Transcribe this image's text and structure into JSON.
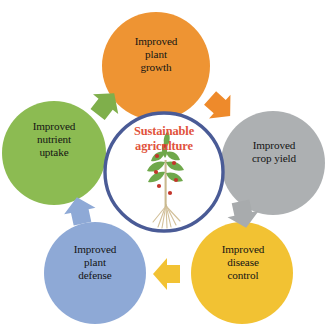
{
  "diagram": {
    "title": "Sustainable agriculture",
    "title_color": "#E1533C",
    "center_ring_color": "#4A5B96",
    "background_color": "#FFFFFF",
    "type": "cycle-diagram",
    "center": {
      "label": "Sustainable\nagriculture",
      "illustration": "plant-with-fruit-and-roots",
      "leaf_color": "#6FA84B",
      "fruit_color": "#C3352B",
      "root_color": "#D9C9A8",
      "stem_color": "#C9B98F"
    },
    "nodes": [
      {
        "id": "plant-growth",
        "label": "Improved\nplant\ngrowth",
        "color": "#EE9433",
        "position": "top"
      },
      {
        "id": "crop-yield",
        "label": "Improved\ncrop yield",
        "color": "#ADB0B2",
        "position": "right"
      },
      {
        "id": "disease-control",
        "label": "Improved\ndisease\ncontrol",
        "color": "#F2C233",
        "position": "bottom-right"
      },
      {
        "id": "plant-defense",
        "label": "Improved\nplant\ndefense",
        "color": "#8EA9D6",
        "position": "bottom-left"
      },
      {
        "id": "nutrient-uptake",
        "label": "Improved\nnutrient\nuptake",
        "color": "#8CBB52",
        "position": "left"
      }
    ],
    "arrows": [
      {
        "id": "nutrient-uptake-to-plant-growth",
        "color": "#7FAF4B",
        "direction": "up-right"
      },
      {
        "id": "plant-growth-to-crop-yield",
        "color": "#EE8A2B",
        "direction": "down-right"
      },
      {
        "id": "crop-yield-to-disease-control",
        "color": "#A8ABAD",
        "direction": "down"
      },
      {
        "id": "disease-control-to-plant-defense",
        "color": "#F2C233",
        "direction": "left"
      },
      {
        "id": "plant-defense-to-nutrient-uptake",
        "color": "#8EA9D6",
        "direction": "up"
      }
    ]
  }
}
